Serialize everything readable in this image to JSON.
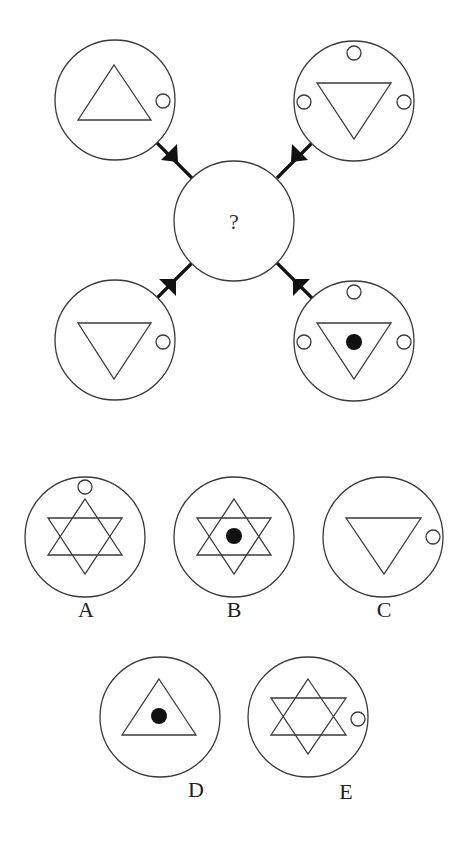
{
  "puzzle": {
    "question_mark": "?",
    "colors": {
      "stroke": "#3a3a3a",
      "fill_dot": "#111111",
      "arrow": "#111111",
      "background": "#ffffff"
    },
    "top_figures": [
      {
        "position": "top-left",
        "shape": "triangle-up",
        "center_dot": false,
        "small_circles": [
          "right"
        ]
      },
      {
        "position": "top-right",
        "shape": "triangle-down",
        "center_dot": false,
        "small_circles": [
          "top",
          "left",
          "right"
        ]
      },
      {
        "position": "bottom-left",
        "shape": "triangle-down",
        "center_dot": false,
        "small_circles": [
          "right"
        ]
      },
      {
        "position": "bottom-right",
        "shape": "triangle-down",
        "center_dot": true,
        "small_circles": [
          "top",
          "left",
          "right"
        ]
      }
    ],
    "center": {
      "label": "?",
      "arrows_pointing_in": 4
    }
  },
  "options": [
    {
      "label": "A",
      "shape": "hexagram",
      "center_dot": false,
      "small_circles": [
        "top"
      ]
    },
    {
      "label": "B",
      "shape": "hexagram",
      "center_dot": true,
      "small_circles": []
    },
    {
      "label": "C",
      "shape": "triangle-down",
      "center_dot": false,
      "small_circles": [
        "right"
      ]
    },
    {
      "label": "D",
      "shape": "triangle-up",
      "center_dot": true,
      "small_circles": []
    },
    {
      "label": "E",
      "shape": "hexagram",
      "center_dot": false,
      "small_circles": [
        "right"
      ]
    }
  ]
}
